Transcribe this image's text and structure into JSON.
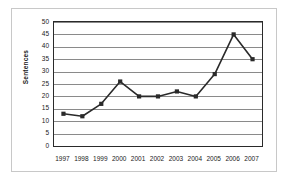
{
  "chart_data": {
    "type": "line",
    "title": "",
    "xlabel": "",
    "ylabel": "Sentences",
    "categories": [
      "1997",
      "1998",
      "1999",
      "2000",
      "2001",
      "2002",
      "2003",
      "2004",
      "2005",
      "2006",
      "2007"
    ],
    "values": [
      13,
      12,
      17,
      26,
      20,
      20,
      22,
      20,
      29,
      45,
      35
    ],
    "ylim": [
      0,
      50
    ],
    "ytick_labels": [
      "0",
      "5",
      "10",
      "15",
      "20",
      "25",
      "30",
      "35",
      "40",
      "45",
      "50"
    ],
    "ytick_values": [
      0,
      5,
      10,
      15,
      20,
      25,
      30,
      35,
      40,
      45,
      50
    ],
    "grid": true,
    "legend": false,
    "marker": "square",
    "series_color": "#2a2a2a",
    "gridline_color": "#8a8a8a",
    "axis_color": "#2a2a2a",
    "frame_color": "#c8c8c8",
    "background": "#ffffff"
  }
}
